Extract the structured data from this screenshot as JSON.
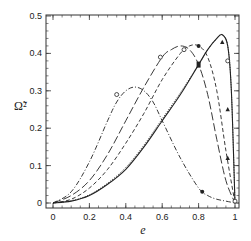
{
  "chart_data": {
    "type": "line",
    "title": "",
    "xlabel": "e",
    "ylabel": "Ω̃²",
    "xlim": [
      -0.05,
      1.03
    ],
    "ylim": [
      -0.01,
      0.5
    ],
    "xticks": [
      0,
      0.2,
      0.4,
      0.6,
      0.8,
      1
    ],
    "xtick_labels": [
      "0",
      "0.2",
      "0.4",
      "0.6",
      "0.8",
      "1"
    ],
    "yticks": [
      0,
      0.1,
      0.2,
      0.3,
      0.4,
      0.5
    ],
    "ytick_labels": [
      "0",
      "0.1",
      "0.2",
      "0.3",
      "0.4",
      "0.5"
    ],
    "grid": false,
    "legend": null,
    "series": [
      {
        "name": "dash-dot",
        "style": "dashdot",
        "x": [
          0,
          0.1,
          0.2,
          0.3,
          0.35,
          0.4,
          0.45,
          0.5,
          0.55,
          0.6,
          0.7,
          0.8,
          0.85,
          0.9,
          0.95,
          1.0
        ],
        "y": [
          0,
          0.03,
          0.11,
          0.22,
          0.27,
          0.3,
          0.31,
          0.3,
          0.27,
          0.22,
          0.12,
          0.04,
          0.02,
          0.01,
          0.005,
          0
        ],
        "markers": [
          {
            "x": 0.35,
            "y": 0.29,
            "shape": "open-circle"
          },
          {
            "x": 0.82,
            "y": 0.03,
            "shape": "filled-circle"
          },
          {
            "x": 1.0,
            "y": 0.005,
            "shape": "open-circle"
          }
        ]
      },
      {
        "name": "long-dash",
        "style": "longdash",
        "x": [
          0,
          0.1,
          0.2,
          0.3,
          0.4,
          0.5,
          0.6,
          0.65,
          0.7,
          0.75,
          0.8,
          0.85,
          0.9,
          0.95,
          1.0
        ],
        "y": [
          0,
          0.02,
          0.06,
          0.13,
          0.22,
          0.31,
          0.39,
          0.41,
          0.42,
          0.41,
          0.37,
          0.29,
          0.17,
          0.06,
          0
        ],
        "markers": [
          {
            "x": 0.59,
            "y": 0.39,
            "shape": "open-circle"
          }
        ]
      },
      {
        "name": "short-dash",
        "style": "dash",
        "x": [
          0,
          0.1,
          0.2,
          0.3,
          0.4,
          0.5,
          0.6,
          0.7,
          0.75,
          0.8,
          0.85,
          0.9,
          0.95,
          1.0
        ],
        "y": [
          0,
          0.01,
          0.04,
          0.09,
          0.16,
          0.24,
          0.33,
          0.4,
          0.42,
          0.42,
          0.39,
          0.3,
          0.14,
          0
        ],
        "markers": [
          {
            "x": 0.72,
            "y": 0.41,
            "shape": "open-circle"
          },
          {
            "x": 0.8,
            "y": 0.42,
            "shape": "filled-circle"
          },
          {
            "x": 0.96,
            "y": 0.25,
            "shape": "filled-triangle"
          },
          {
            "x": 0.96,
            "y": 0.12,
            "shape": "filled-triangle"
          }
        ]
      },
      {
        "name": "solid",
        "style": "solid",
        "x": [
          0,
          0.1,
          0.2,
          0.3,
          0.4,
          0.5,
          0.6,
          0.7,
          0.8,
          0.85,
          0.9,
          0.93,
          0.96,
          0.98,
          1.0
        ],
        "y": [
          0,
          0.005,
          0.02,
          0.05,
          0.09,
          0.15,
          0.22,
          0.29,
          0.37,
          0.41,
          0.44,
          0.45,
          0.42,
          0.3,
          0
        ],
        "markers": [
          {
            "x": 0.8,
            "y": 0.37,
            "shape": "filled-square"
          },
          {
            "x": 0.93,
            "y": 0.43,
            "shape": "filled-triangle"
          },
          {
            "x": 0.96,
            "y": 0.38,
            "shape": "open-circle"
          }
        ]
      },
      {
        "name": "dotted",
        "style": "dotted",
        "x": [
          0,
          0.1,
          0.2,
          0.3,
          0.4,
          0.5,
          0.6,
          0.7,
          0.8,
          0.85,
          0.9,
          0.93,
          0.96,
          0.98,
          1.0
        ],
        "y": [
          0,
          0.006,
          0.022,
          0.053,
          0.095,
          0.155,
          0.225,
          0.295,
          0.37,
          0.41,
          0.44,
          0.45,
          0.42,
          0.3,
          0
        ],
        "markers": []
      }
    ]
  }
}
